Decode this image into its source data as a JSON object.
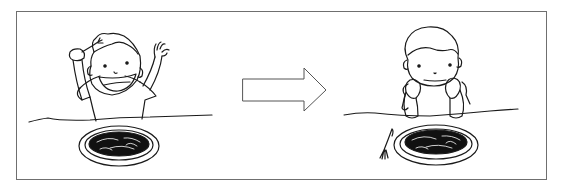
{
  "figure": {
    "type": "before-after illustration",
    "panels": [
      {
        "id": "before",
        "description": "Happy child raising fork and hand above a plate of spaghetti",
        "mood": "excited"
      },
      {
        "id": "after",
        "description": "Bored child resting chin on hands, fork put down beside plate of spaghetti",
        "mood": "bored"
      }
    ],
    "connector": "right-arrow"
  },
  "colors": {
    "line": "#1a1a1a",
    "frame": "#6f6f6f",
    "fill": "#ffffff",
    "food": "#111111"
  }
}
